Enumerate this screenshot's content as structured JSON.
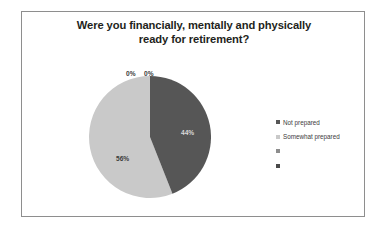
{
  "chart_data": {
    "type": "pie",
    "title": "Were you financially, mentally and physically ready for retirement?",
    "title_line_1": "Were you financially, mentally and physically",
    "title_line_2": "ready for retirement?",
    "categories": [
      "Not prepared",
      "Somewhat prepared",
      "",
      ""
    ],
    "values": [
      44,
      56,
      0,
      0
    ],
    "data_labels": [
      "44%",
      "56%",
      "0%",
      "0%"
    ],
    "colors": [
      "#565656",
      "#c9c9c9",
      "#8d8d8d",
      "#4a4a4a"
    ],
    "legend_position": "right",
    "grid": false,
    "start_angle_deg": 0,
    "direction": "clockwise",
    "xlabel": "",
    "ylabel": ""
  },
  "labels": {
    "slice_44": "44%",
    "slice_56": "56%",
    "slice_0_a": "0%",
    "slice_0_b": "0%"
  },
  "legend": {
    "items": [
      {
        "label": "Not prepared",
        "color": "#565656"
      },
      {
        "label": "Somewhat prepared",
        "color": "#c9c9c9"
      },
      {
        "label": "",
        "color": "#8d8d8d"
      },
      {
        "label": "",
        "color": "#4a4a4a"
      }
    ]
  },
  "colors": {
    "slice_dark": "#565656",
    "slice_light": "#c9c9c9",
    "frame_border": "#8e8e8e",
    "title_text": "#231f20",
    "background": "#ffffff"
  }
}
